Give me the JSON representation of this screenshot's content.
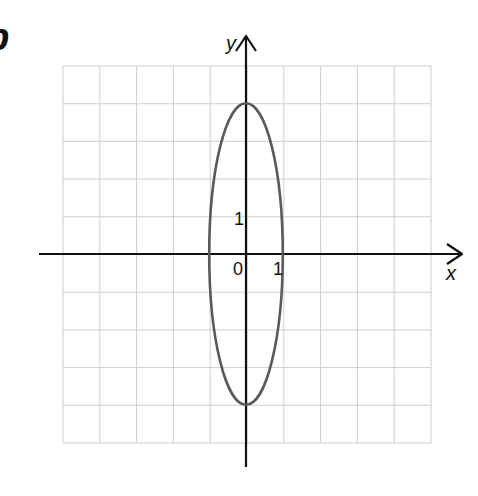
{
  "part_label": "b",
  "chart_data": {
    "type": "line",
    "title": "",
    "xlabel": "x",
    "ylabel": "y",
    "xlim": [
      -5,
      5
    ],
    "ylim": [
      -5,
      5
    ],
    "grid": true,
    "tick_labels": {
      "origin": "0",
      "x": [
        "1"
      ],
      "y": [
        "1"
      ]
    },
    "series": [
      {
        "name": "ellipse",
        "equation": "x^2 + y^2/16 = 1",
        "center": [
          0,
          0
        ],
        "semi_axis_x": 1,
        "semi_axis_y": 4,
        "points": [
          [
            1,
            0
          ],
          [
            0,
            4
          ],
          [
            -1,
            0
          ],
          [
            0,
            -4
          ]
        ]
      }
    ],
    "colors": {
      "curve": "#5a5a5a",
      "axes": "#111111",
      "grid": "#cfcfcf"
    }
  }
}
